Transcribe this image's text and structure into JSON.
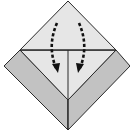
{
  "diagram": {
    "type": "origami-fold-step",
    "colors": {
      "background": "#ffffff",
      "paper_front": "#e6e6e6",
      "paper_back": "#c2c2c2",
      "line": "#2a2a2a",
      "arrow": "#111111"
    },
    "shapes": {
      "top_triangle": {
        "points": "68,1 116,50 20,50"
      },
      "left_band": {
        "points": "20,50 4,66 68,130 68,100"
      },
      "right_band": {
        "points": "116,50 130,66 68,130 68,100"
      },
      "inner_triangle": {
        "points": "20,50 116,50 68,100"
      },
      "horizontal_crease": {
        "x1": 20,
        "y1": 50,
        "x2": 116,
        "y2": 50
      },
      "center_crease": {
        "x1": 68,
        "y1": 50,
        "x2": 68,
        "y2": 130
      }
    },
    "arrows": [
      {
        "name": "left-fold-arrow",
        "path": "M57,23 Q47,46 56,68",
        "head": "52,64 58,73 60,63"
      },
      {
        "name": "right-fold-arrow",
        "path": "M79,23 Q89,46 80,68",
        "head": "76,63 78,73 84,64"
      }
    ]
  }
}
